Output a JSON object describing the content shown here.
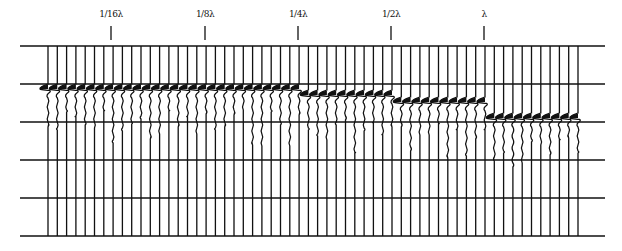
{
  "figure": {
    "type": "seismic-wiggle-trace-section",
    "background": "#ffffff",
    "ink": "#111111",
    "width": 622,
    "height": 251
  },
  "markers": [
    {
      "label": "1/16λ",
      "x": 111
    },
    {
      "label": "1/8λ",
      "x": 205
    },
    {
      "label": "1/4λ",
      "x": 298
    },
    {
      "label": "1/2λ",
      "x": 391
    },
    {
      "label": "λ",
      "x": 484
    }
  ],
  "timing_lines": {
    "x_start": 20,
    "x_end": 605,
    "y": [
      46,
      84,
      122,
      160,
      198,
      236
    ]
  },
  "traces": {
    "count": 58,
    "x_first": 48,
    "x_last": 578,
    "y_top": 46,
    "y_bottom": 236
  },
  "events": [
    {
      "name": "segment-1",
      "x_from": 40,
      "x_to": 300,
      "y": 90
    },
    {
      "name": "segment-2",
      "x_from": 300,
      "x_to": 395,
      "y": 96
    },
    {
      "name": "segment-3",
      "x_from": 395,
      "x_to": 490,
      "y": 103
    },
    {
      "name": "segment-4",
      "x_from": 490,
      "x_to": 582,
      "y": 119
    }
  ]
}
